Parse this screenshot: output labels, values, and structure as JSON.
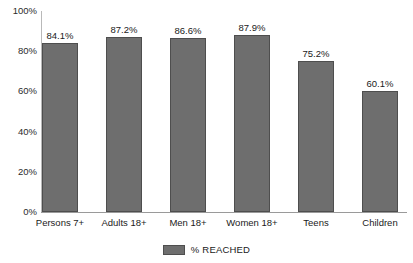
{
  "chart_data": {
    "type": "bar",
    "title": "",
    "xlabel": "",
    "ylabel": "",
    "categories": [
      "Persons 7+",
      "Adults 18+",
      "Men 18+",
      "Women 18+",
      "Teens",
      "Children"
    ],
    "values": [
      84.1,
      87.2,
      86.6,
      87.9,
      75.2,
      60.1
    ],
    "value_labels": [
      "84.1%",
      "87.2%",
      "86.6%",
      "87.9%",
      "75.2%",
      "60.1%"
    ],
    "series": [
      {
        "name": "% REACHED",
        "values": [
          84.1,
          87.2,
          86.6,
          87.9,
          75.2,
          60.1
        ],
        "color": "#6e6e6e"
      }
    ],
    "ylim": [
      0,
      100
    ],
    "ytick_values": [
      0,
      20,
      40,
      60,
      80,
      100
    ],
    "ytick_labels": [
      "0%",
      "20%",
      "40%",
      "60%",
      "80%",
      "100%"
    ],
    "grid": false,
    "legend_position": "bottom",
    "legend_entries": [
      "% REACHED"
    ],
    "bar_color": "#6e6e6e",
    "bar_border_color": "#4e4e4e",
    "axis_color": "#b9b9b9"
  },
  "legend": {
    "label": "% REACHED"
  }
}
